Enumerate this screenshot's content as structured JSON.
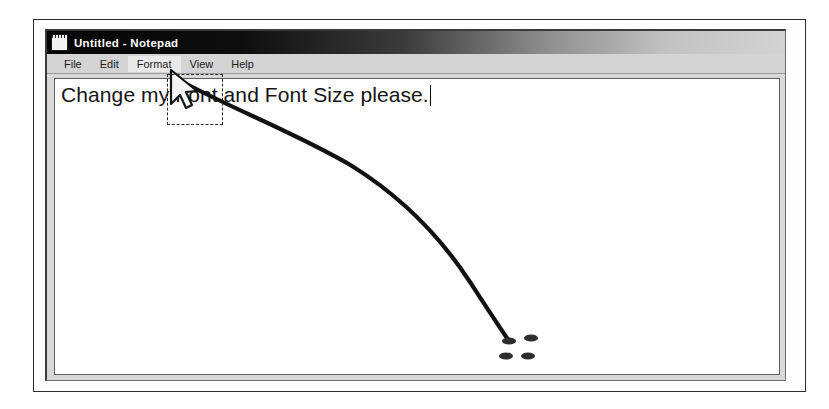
{
  "figure": {
    "background_color": "#ffffff",
    "border_color": "#2b2b2b"
  },
  "window": {
    "title": "Untitled - Notepad",
    "icon": "notepad-document-icon",
    "titlebar_gradient_from": "#050505",
    "titlebar_gradient_to": "#d3d3d3",
    "menubar_color": "#d4d4d4",
    "menu": [
      {
        "label": "File",
        "highlighted": false
      },
      {
        "label": "Edit",
        "highlighted": false
      },
      {
        "label": "Format",
        "highlighted": true
      },
      {
        "label": "View",
        "highlighted": false
      },
      {
        "label": "Help",
        "highlighted": false
      }
    ],
    "document": {
      "text": "Change my Font and Font Size please.",
      "caret_visible": true,
      "text_color": "#151515",
      "background_color": "#ffffff"
    }
  },
  "annotations": {
    "cursor": {
      "name": "mouse-pointer-arrow",
      "x": 172,
      "y": 72,
      "color": "#1a1a1a"
    },
    "focus_rectangle": {
      "name": "format-menu-focus-rectangle",
      "x": 167,
      "y": 74,
      "width": 56,
      "height": 51,
      "style": "dashed",
      "color": "#2a2a2a"
    },
    "pointer_line": {
      "name": "hand-drawn-curve",
      "color": "#121212",
      "from_x": 176,
      "from_y": 78,
      "to_x": 515,
      "to_y": 345
    },
    "ink_marks": {
      "name": "ink-blob-cluster",
      "color": "#2e2e2e",
      "blobs": [
        {
          "cx": 509,
          "cy": 341,
          "rx": 7,
          "ry": 3.5
        },
        {
          "cx": 531,
          "cy": 338,
          "rx": 7,
          "ry": 3.5
        },
        {
          "cx": 506,
          "cy": 356,
          "rx": 7,
          "ry": 3.5
        },
        {
          "cx": 528,
          "cy": 356,
          "rx": 7,
          "ry": 3.5
        }
      ]
    }
  }
}
